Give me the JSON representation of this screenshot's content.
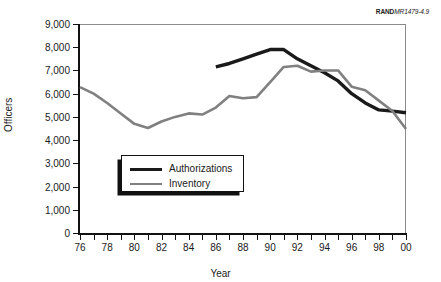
{
  "credit": {
    "mark": "RAND",
    "number": "MR1479-4.9"
  },
  "colors": {
    "authorizations": "#1a1a1a",
    "inventory": "#808080",
    "axis": "#111111",
    "frame": "#8a8a8a",
    "background": "#ffffff"
  },
  "chart_data": {
    "type": "line",
    "title": "",
    "xlabel": "Year",
    "ylabel": "Officers",
    "xlim": [
      76,
      100
    ],
    "ylim": [
      0,
      9000
    ],
    "ytick_labels": [
      "9,000",
      "8,000",
      "7,000",
      "6,000",
      "5,000",
      "4,000",
      "3,000",
      "2,000",
      "1,000",
      "0"
    ],
    "ytick_values": [
      9000,
      8000,
      7000,
      6000,
      5000,
      4000,
      3000,
      2000,
      1000,
      0
    ],
    "xtick_values": [
      76,
      77,
      78,
      79,
      80,
      81,
      82,
      83,
      84,
      85,
      86,
      87,
      88,
      89,
      90,
      91,
      92,
      93,
      94,
      95,
      96,
      97,
      98,
      99,
      100
    ],
    "xtick_labels": [
      "76",
      "",
      "78",
      "",
      "80",
      "",
      "82",
      "",
      "84",
      "",
      "86",
      "",
      "88",
      "",
      "90",
      "",
      "92",
      "",
      "94",
      "",
      "96",
      "",
      "98",
      "",
      "00"
    ],
    "grid": false,
    "legend_position": "inside-lower-left",
    "series": [
      {
        "name": "Authorizations",
        "color": "#1a1a1a",
        "x": [
          86,
          87,
          88,
          89,
          90,
          91,
          92,
          93,
          94,
          95,
          96,
          97,
          98,
          99,
          100
        ],
        "values": [
          7150,
          7300,
          7500,
          7700,
          7900,
          7900,
          7500,
          7200,
          6900,
          6550,
          6000,
          5600,
          5300,
          5250,
          5180
        ]
      },
      {
        "name": "Inventory",
        "color": "#808080",
        "x": [
          76,
          77,
          78,
          79,
          80,
          81,
          82,
          83,
          84,
          85,
          86,
          87,
          88,
          89,
          90,
          91,
          92,
          93,
          94,
          95,
          96,
          97,
          98,
          99,
          100
        ],
        "values": [
          6280,
          6000,
          5600,
          5150,
          4700,
          4520,
          4800,
          5000,
          5150,
          5100,
          5400,
          5900,
          5800,
          5850,
          6500,
          7150,
          7200,
          6950,
          7000,
          7000,
          6300,
          6150,
          5700,
          5250,
          4480
        ]
      }
    ]
  },
  "legend": {
    "items": [
      {
        "label": "Authorizations",
        "color": "#1a1a1a",
        "width": 3.4
      },
      {
        "label": "Inventory",
        "color": "#808080",
        "width": 2.6
      }
    ]
  }
}
